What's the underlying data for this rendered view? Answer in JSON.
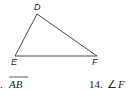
{
  "figure": {
    "shape": "triangle",
    "vertices": [
      {
        "label": "D",
        "x": 37,
        "y": 14
      },
      {
        "label": "E",
        "x": 15,
        "y": 56
      },
      {
        "label": "F",
        "x": 97,
        "y": 56
      }
    ],
    "stroke_color": "#333333"
  },
  "questions": [
    {
      "number": ".",
      "text": "AB",
      "notation": "segment-overline"
    },
    {
      "number": "14.",
      "text": "F",
      "notation": "angle"
    }
  ],
  "symbols": {
    "angle": "∠"
  }
}
